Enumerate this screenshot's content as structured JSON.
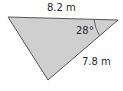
{
  "diagram": {
    "type": "triangle",
    "fill": "#cfcfcf",
    "stroke": "#555555",
    "vertices": [
      [
        8,
        17
      ],
      [
        118,
        20
      ],
      [
        48,
        80
      ]
    ],
    "labels": {
      "top_side": "8.2 m",
      "right_side": "7.8 m",
      "angle": "28°"
    }
  }
}
